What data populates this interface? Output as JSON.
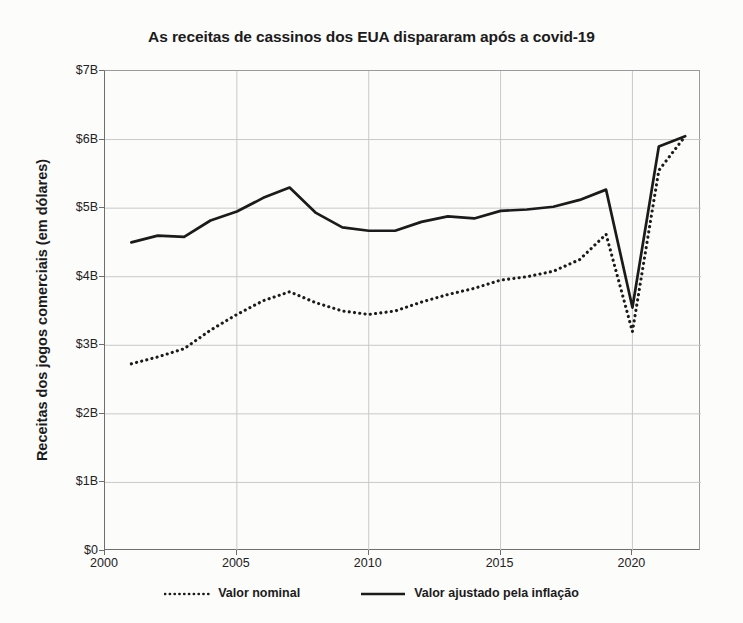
{
  "chart_data": {
    "type": "line",
    "title": "As receitas de cassinos dos EUA dispararam após a covid-19",
    "xlabel": "",
    "ylabel": "Receitas dos jogos comerciais (em dólares)",
    "xlim": [
      2000,
      2022.6
    ],
    "ylim": [
      0,
      7
    ],
    "grid": true,
    "legend_position": "bottom",
    "x_ticks": [
      "2000",
      "2005",
      "2010",
      "2015",
      "2020"
    ],
    "x_tick_values": [
      2000,
      2005,
      2010,
      2015,
      2020
    ],
    "y_ticks": [
      "$0",
      "$1B",
      "$2B",
      "$3B",
      "$4B",
      "$5B",
      "$6B",
      "$7B"
    ],
    "y_tick_values": [
      0,
      1,
      2,
      3,
      4,
      5,
      6,
      7
    ],
    "x": [
      2001,
      2002,
      2003,
      2004,
      2005,
      2006,
      2007,
      2008,
      2009,
      2010,
      2011,
      2012,
      2013,
      2014,
      2015,
      2016,
      2017,
      2018,
      2019,
      2020,
      2021,
      2022
    ],
    "series": [
      {
        "name": "Valor nominal",
        "style": "dotted",
        "color": "#1b1b1b",
        "values": [
          2.73,
          2.83,
          2.95,
          3.22,
          3.45,
          3.65,
          3.78,
          3.62,
          3.5,
          3.45,
          3.5,
          3.63,
          3.74,
          3.83,
          3.95,
          4.0,
          4.08,
          4.25,
          4.62,
          3.2,
          5.55,
          6.05
        ]
      },
      {
        "name": "Valor ajustado pela inflação",
        "style": "solid",
        "color": "#1b1b1b",
        "values": [
          4.5,
          4.6,
          4.58,
          4.82,
          4.95,
          5.15,
          5.3,
          4.93,
          4.72,
          4.67,
          4.67,
          4.8,
          4.88,
          4.85,
          4.96,
          4.98,
          5.02,
          5.12,
          5.27,
          3.55,
          5.9,
          6.05
        ]
      }
    ]
  },
  "legend": {
    "items": [
      {
        "label": "Valor nominal",
        "style": "dotted"
      },
      {
        "label": "Valor ajustado pela inflação",
        "style": "solid"
      }
    ]
  },
  "colors": {
    "background": "#fcfcfb",
    "grid": "#c9c9c9",
    "axis": "#6e6e6e",
    "line": "#1b1b1b",
    "text": "#1b1b1b"
  }
}
